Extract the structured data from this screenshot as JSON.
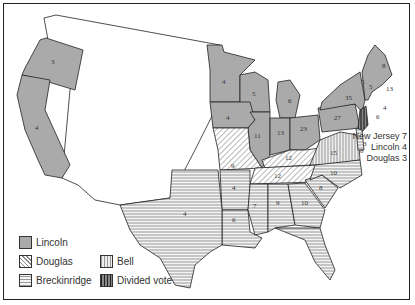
{
  "map": {
    "title": "",
    "colors": {
      "lincoln": "#aaaaaa",
      "stroke": "#222222",
      "background": "#ffffff"
    },
    "states": [
      {
        "name": "Oregon",
        "votes": "3",
        "winner": "Lincoln"
      },
      {
        "name": "California",
        "votes": "4",
        "winner": "Lincoln"
      },
      {
        "name": "Minnesota",
        "votes": "4",
        "winner": "Lincoln"
      },
      {
        "name": "Wisconsin",
        "votes": "5",
        "winner": "Lincoln"
      },
      {
        "name": "Michigan",
        "votes": "6",
        "winner": "Lincoln"
      },
      {
        "name": "Iowa",
        "votes": "4",
        "winner": "Lincoln"
      },
      {
        "name": "Illinois",
        "votes": "11",
        "winner": "Lincoln"
      },
      {
        "name": "Indiana",
        "votes": "13",
        "winner": "Lincoln"
      },
      {
        "name": "Ohio",
        "votes": "23",
        "winner": "Lincoln"
      },
      {
        "name": "Pennsylvania",
        "votes": "27",
        "winner": "Lincoln"
      },
      {
        "name": "New York",
        "votes": "35",
        "winner": "Lincoln"
      },
      {
        "name": "Vermont",
        "votes": "5",
        "winner": "Lincoln"
      },
      {
        "name": "New Hampshire",
        "votes": "5",
        "winner": "Lincoln"
      },
      {
        "name": "Maine",
        "votes": "8",
        "winner": "Lincoln"
      },
      {
        "name": "Massachusetts",
        "votes": "13",
        "winner": "Lincoln"
      },
      {
        "name": "Rhode Island",
        "votes": "4",
        "winner": "Lincoln"
      },
      {
        "name": "Connecticut",
        "votes": "6",
        "winner": "Lincoln"
      },
      {
        "name": "Missouri",
        "votes": "9",
        "winner": "Douglas"
      },
      {
        "name": "Kentucky",
        "votes": "12",
        "winner": "Bell"
      },
      {
        "name": "Virginia",
        "votes": "15",
        "winner": "Bell"
      },
      {
        "name": "Tennessee",
        "votes": "12",
        "winner": "Bell"
      },
      {
        "name": "North Carolina",
        "votes": "10",
        "winner": "Breckinridge"
      },
      {
        "name": "South Carolina",
        "votes": "8",
        "winner": "Breckinridge"
      },
      {
        "name": "Georgia",
        "votes": "10",
        "winner": "Breckinridge"
      },
      {
        "name": "Alabama",
        "votes": "9",
        "winner": "Breckinridge"
      },
      {
        "name": "Mississippi",
        "votes": "7",
        "winner": "Breckinridge"
      },
      {
        "name": "Louisiana",
        "votes": "6",
        "winner": "Breckinridge"
      },
      {
        "name": "Arkansas",
        "votes": "4",
        "winner": "Breckinridge"
      },
      {
        "name": "Texas",
        "votes": "4",
        "winner": "Breckinridge"
      },
      {
        "name": "Florida",
        "votes": "3",
        "winner": "Breckinridge"
      },
      {
        "name": "Maryland",
        "votes": "8",
        "winner": "Breckinridge"
      },
      {
        "name": "Delaware",
        "votes": "3",
        "winner": "Breckinridge"
      },
      {
        "name": "New Jersey",
        "votes": "7",
        "winner": "Divided vote"
      }
    ],
    "nj_note": {
      "line1": "New Jersey 7",
      "line2": "Lincoln 4",
      "line3": "Douglas 3"
    }
  },
  "legend": {
    "items": [
      {
        "label": "Lincoln",
        "pattern": "solid"
      },
      {
        "label": "Douglas",
        "pattern": "diagonal"
      },
      {
        "label": "Breckinridge",
        "pattern": "horizontal"
      },
      {
        "label": "Bell",
        "pattern": "vertical-light"
      },
      {
        "label": "Divided vote",
        "pattern": "vertical-dark"
      }
    ]
  }
}
